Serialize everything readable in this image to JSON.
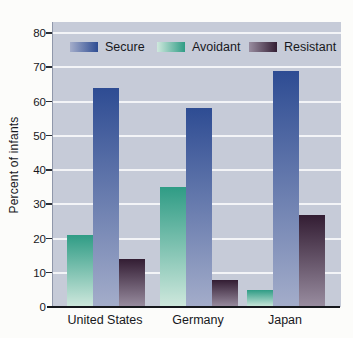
{
  "figure": {
    "background": "#fcfcfa",
    "plot_background": "#c6cbd8",
    "gridline_color": "#f3f4f7",
    "axis_color": "#15171c",
    "text_color": "#17181c"
  },
  "chart_data": {
    "type": "bar",
    "title": "",
    "xlabel": "",
    "ylabel": "Percent of infants",
    "categories": [
      "United States",
      "Germany",
      "Japan"
    ],
    "yticks": [
      0,
      10,
      20,
      30,
      40,
      50,
      60,
      70,
      80
    ],
    "ylim": [
      0,
      83
    ],
    "unit": "percent",
    "grid": true,
    "legend_position": "top-inside",
    "legend_order": [
      "Secure",
      "Avoidant",
      "Resistant"
    ],
    "bar_order_in_group": [
      "Avoidant",
      "Secure",
      "Resistant"
    ],
    "series": [
      {
        "name": "Secure",
        "values": [
          64,
          58,
          69
        ],
        "color_dark": "#2e4c93",
        "color_light": "#a4adca"
      },
      {
        "name": "Avoidant",
        "values": [
          21,
          35,
          5
        ],
        "color_dark": "#2f9c85",
        "color_light": "#cfe8dd"
      },
      {
        "name": "Resistant",
        "values": [
          14,
          8,
          27
        ],
        "color_dark": "#331d33",
        "color_light": "#998da0"
      }
    ]
  }
}
